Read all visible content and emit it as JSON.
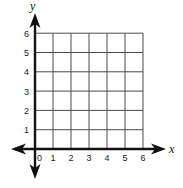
{
  "diagram": {
    "type": "coordinate-grid",
    "quadrant": "first",
    "axes": {
      "x": {
        "label": "x",
        "min": 0,
        "max": 6,
        "ticks": [
          "0",
          "1",
          "2",
          "3",
          "4",
          "5",
          "6"
        ]
      },
      "y": {
        "label": "y",
        "min": 0,
        "max": 6,
        "ticks": [
          "1",
          "2",
          "3",
          "4",
          "5",
          "6"
        ]
      }
    },
    "grid": {
      "columns": 6,
      "rows": 6,
      "visible": true
    },
    "arrows": [
      "left",
      "right",
      "up",
      "down"
    ],
    "colors": {
      "axis": "#111111",
      "grid": "#4a4a4a",
      "background": "#ffffff"
    }
  }
}
